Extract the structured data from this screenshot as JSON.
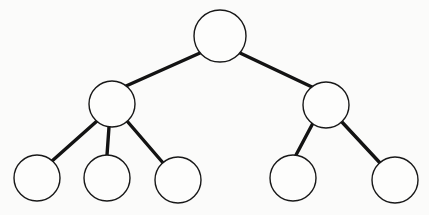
{
  "diagram": {
    "type": "node-link-tree",
    "background_color": "#fbfbfa",
    "node_fill_color": "#fdfdfc",
    "node_stroke_color": "#181818",
    "node_stroke_width": 1.4,
    "edge_color": "#131313",
    "edge_width": 3.4,
    "node_labels_present": "none",
    "node_count": 8,
    "edge_count": 7,
    "depth": 3,
    "nodes": [
      {
        "id": "root",
        "label": "",
        "level": 0,
        "cx": 220,
        "cy": 36,
        "r": 26
      },
      {
        "id": "l1",
        "label": "",
        "level": 1,
        "cx": 112,
        "cy": 104,
        "r": 23
      },
      {
        "id": "r1",
        "label": "",
        "level": 1,
        "cx": 326,
        "cy": 105,
        "r": 23
      },
      {
        "id": "l1c1",
        "label": "",
        "level": 2,
        "cx": 37,
        "cy": 178,
        "r": 23
      },
      {
        "id": "l1c2",
        "label": "",
        "level": 2,
        "cx": 107,
        "cy": 178,
        "r": 23
      },
      {
        "id": "l1c3",
        "label": "",
        "level": 2,
        "cx": 178,
        "cy": 180,
        "r": 23
      },
      {
        "id": "r1c1",
        "label": "",
        "level": 2,
        "cx": 293,
        "cy": 178,
        "r": 23
      },
      {
        "id": "r1c2",
        "label": "",
        "level": 2,
        "cx": 395,
        "cy": 180,
        "r": 23
      }
    ],
    "edges": [
      {
        "from": "root",
        "to": "l1",
        "x1": 200,
        "y1": 53,
        "x2": 126,
        "y2": 86
      },
      {
        "from": "root",
        "to": "r1",
        "x1": 240,
        "y1": 53,
        "x2": 312,
        "y2": 87
      },
      {
        "from": "l1",
        "to": "l1c1",
        "x1": 97,
        "y1": 121,
        "x2": 52,
        "y2": 161
      },
      {
        "from": "l1",
        "to": "l1c2",
        "x1": 109,
        "y1": 127,
        "x2": 107,
        "y2": 155
      },
      {
        "from": "l1",
        "to": "l1c3",
        "x1": 127,
        "y1": 121,
        "x2": 164,
        "y2": 164
      },
      {
        "from": "r1",
        "to": "r1c1",
        "x1": 313,
        "y1": 123,
        "x2": 296,
        "y2": 155
      },
      {
        "from": "r1",
        "to": "r1c2",
        "x1": 341,
        "y1": 121,
        "x2": 381,
        "y2": 164
      }
    ]
  }
}
